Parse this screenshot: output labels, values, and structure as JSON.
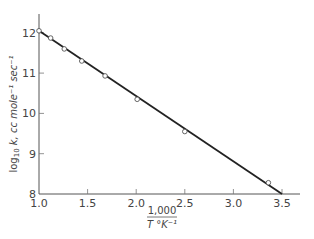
{
  "chart_data": {
    "type": "scatter",
    "title": "",
    "xlabel_numerator": "1,000",
    "xlabel_denominator": "T °K⁻¹",
    "ylabel_prefix": "log",
    "ylabel_sub": "10",
    "ylabel_rest": " k, cc mole⁻¹ sec⁻¹",
    "xlim": [
      1.0,
      3.6
    ],
    "ylim": [
      8,
      12.5
    ],
    "x_ticks": [
      1.0,
      1.5,
      2.0,
      2.5,
      3.0,
      3.5
    ],
    "x_tick_labels": [
      "1.0",
      "1.5",
      "2.0",
      "2.5",
      "3.0",
      "3.5"
    ],
    "y_ticks": [
      8,
      9,
      10,
      11,
      12
    ],
    "y_tick_labels": [
      "8",
      "9",
      "10",
      "11",
      "12"
    ],
    "grid": false,
    "series": [
      {
        "name": "measured",
        "marker": "open-circle",
        "x": [
          1.0,
          1.12,
          1.26,
          1.44,
          1.68,
          2.01,
          2.5,
          3.36
        ],
        "y": [
          12.05,
          11.87,
          11.6,
          11.3,
          10.93,
          10.35,
          9.55,
          8.28
        ]
      },
      {
        "name": "fit",
        "style": "line",
        "x": [
          1.0,
          3.5
        ],
        "y": [
          12.05,
          8.0
        ]
      }
    ]
  }
}
